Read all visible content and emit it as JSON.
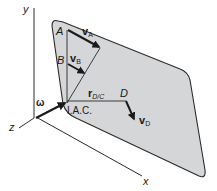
{
  "figure": {
    "type": "rigid body planar motion diagram",
    "colors": {
      "plate_fill": "#d4d6d8",
      "plate_stroke": "#2a2a2a",
      "line": "#2a2a2a",
      "background": "#ffffff"
    }
  },
  "axes": {
    "y_label": "y",
    "z_label": "z",
    "x_label": "x"
  },
  "points": {
    "A": "A",
    "B": "B",
    "D": "D",
    "iac": "I.A.C."
  },
  "vectors": {
    "vA": {
      "main": "v",
      "sub": "A"
    },
    "vB": {
      "main": "v",
      "sub": "B"
    },
    "vD": {
      "main": "v",
      "sub": "D"
    },
    "rDC": {
      "main": "r",
      "sub": "D/C"
    },
    "omega": "ω"
  }
}
